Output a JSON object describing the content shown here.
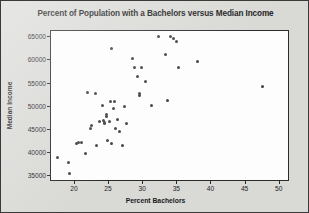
{
  "chart_data": {
    "type": "scatter",
    "title": "Percent of Population with a Bachelors versus Median Income",
    "xlabel": "Percent Bachelors",
    "ylabel": "Median Income",
    "xlim": [
      16.5,
      51.5
    ],
    "ylim": [
      33800,
      66300
    ],
    "xticks": [
      20,
      25,
      30,
      35,
      40,
      45,
      50
    ],
    "xtick_labels": [
      "20",
      "25",
      "30",
      "35",
      "40",
      "45",
      "50"
    ],
    "yticks": [
      35000,
      40000,
      45000,
      50000,
      55000,
      60000,
      65000
    ],
    "ytick_labels": [
      "35000",
      "40000",
      "45000",
      "50000",
      "55000",
      "60000",
      "65000"
    ],
    "grid": false,
    "legend": null,
    "marker_color": "#404040",
    "points": [
      {
        "x": 17.5,
        "y": 39100
      },
      {
        "x": 19.0,
        "y": 37900
      },
      {
        "x": 19.2,
        "y": 35600
      },
      {
        "x": 20.2,
        "y": 42100
      },
      {
        "x": 20.6,
        "y": 42200
      },
      {
        "x": 21.0,
        "y": 42300
      },
      {
        "x": 21.5,
        "y": 40000
      },
      {
        "x": 21.8,
        "y": 53000
      },
      {
        "x": 22.3,
        "y": 45400
      },
      {
        "x": 22.5,
        "y": 46000
      },
      {
        "x": 23.0,
        "y": 52800
      },
      {
        "x": 23.1,
        "y": 41600
      },
      {
        "x": 23.6,
        "y": 46800
      },
      {
        "x": 24.0,
        "y": 50200
      },
      {
        "x": 24.2,
        "y": 47000
      },
      {
        "x": 24.3,
        "y": 46500
      },
      {
        "x": 24.4,
        "y": 46300
      },
      {
        "x": 24.6,
        "y": 48300
      },
      {
        "x": 24.7,
        "y": 47800
      },
      {
        "x": 24.8,
        "y": 42800
      },
      {
        "x": 25.0,
        "y": 46900
      },
      {
        "x": 25.2,
        "y": 51100
      },
      {
        "x": 25.3,
        "y": 42100
      },
      {
        "x": 25.4,
        "y": 62600
      },
      {
        "x": 25.6,
        "y": 49600
      },
      {
        "x": 25.8,
        "y": 51100
      },
      {
        "x": 25.9,
        "y": 45300
      },
      {
        "x": 26.2,
        "y": 47200
      },
      {
        "x": 26.6,
        "y": 44700
      },
      {
        "x": 26.9,
        "y": 41700
      },
      {
        "x": 27.2,
        "y": 50000
      },
      {
        "x": 27.6,
        "y": 46400
      },
      {
        "x": 28.4,
        "y": 60400
      },
      {
        "x": 28.7,
        "y": 58500
      },
      {
        "x": 29.2,
        "y": 56500
      },
      {
        "x": 29.4,
        "y": 52500
      },
      {
        "x": 29.5,
        "y": 52900
      },
      {
        "x": 29.8,
        "y": 58500
      },
      {
        "x": 30.3,
        "y": 55400
      },
      {
        "x": 31.2,
        "y": 50200
      },
      {
        "x": 32.3,
        "y": 65200
      },
      {
        "x": 33.3,
        "y": 61200
      },
      {
        "x": 33.6,
        "y": 51400
      },
      {
        "x": 34.0,
        "y": 65100
      },
      {
        "x": 34.5,
        "y": 64700
      },
      {
        "x": 34.9,
        "y": 64000
      },
      {
        "x": 35.1,
        "y": 58500
      },
      {
        "x": 37.9,
        "y": 59800
      },
      {
        "x": 47.5,
        "y": 54400
      }
    ]
  }
}
